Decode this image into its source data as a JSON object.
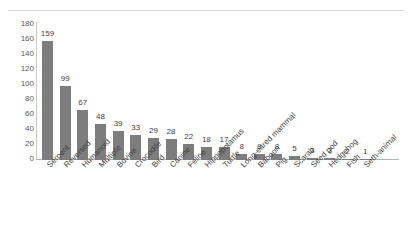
{
  "chart_data": {
    "type": "bar",
    "title": "",
    "subtitle": "",
    "xlabel": "",
    "ylabel": "",
    "ylim": [
      0,
      180
    ],
    "y_ticks": [
      0,
      20,
      40,
      60,
      80,
      100,
      120,
      140,
      160,
      180
    ],
    "grid": false,
    "legend": false,
    "legend_position": "none",
    "bar_color": "#7d7d7d",
    "data_labels_shown": true,
    "categories": [
      "Serpent",
      "Reversed",
      "Humanoid",
      "Multiple",
      "Bovine",
      "Crocodile",
      "Bird",
      "Canine",
      "Feline",
      "Hippopotamus",
      "Turtle",
      "Long-eared mammal",
      "Baboon",
      "Pig",
      "Scarab",
      "Seed pod",
      "Hedgehog",
      "Fish",
      "Seth-animal"
    ],
    "values": [
      159,
      99,
      67,
      48,
      39,
      33,
      29,
      28,
      22,
      18,
      17,
      8,
      8,
      8,
      5,
      3,
      3,
      2,
      1
    ]
  }
}
